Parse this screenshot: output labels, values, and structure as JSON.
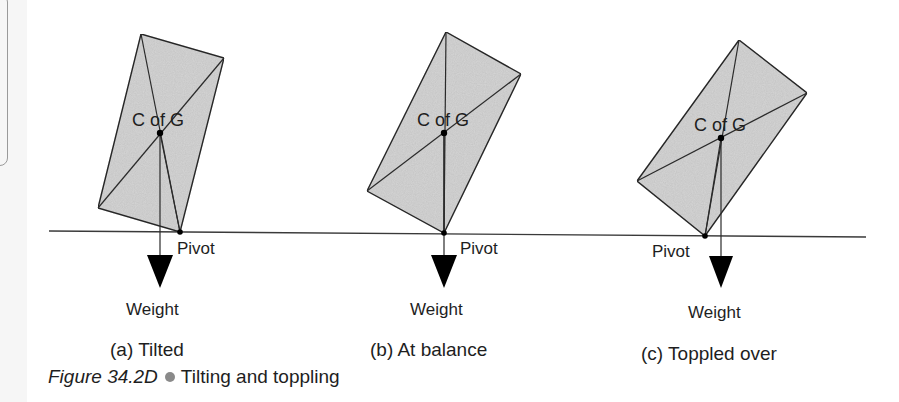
{
  "figure": {
    "number": "Figure 34.2D",
    "title": "Tilting and toppling",
    "bullet_color": "#8a8a8a"
  },
  "colors": {
    "block_fill": "#d6d6d6",
    "stroke": "#2a2a2a",
    "arrow": "#000000",
    "ground": "#3a3a3a"
  },
  "ground_line": {
    "x1": 49,
    "y1": 231,
    "x2": 866,
    "y2": 237
  },
  "panels": [
    {
      "id": "a",
      "caption": "(a) Tilted",
      "cog_label": "C of G",
      "pivot_label": "Pivot",
      "weight_label": "Weight",
      "corners": {
        "top": [
          141,
          34
        ],
        "right": [
          224,
          58
        ],
        "bottom": [
          180,
          232
        ],
        "left": [
          98,
          208
        ]
      },
      "cog": [
        160,
        133
      ],
      "arrow": {
        "x": 160,
        "tri_top": 255,
        "tri_bottom": 288,
        "half_width": 13
      },
      "cog_text": [
        132,
        126
      ],
      "pivot_text": [
        177,
        254
      ],
      "weight_text": [
        126,
        315
      ],
      "caption_pos": [
        110,
        356
      ]
    },
    {
      "id": "b",
      "caption": "(b) At balance",
      "cog_label": "C of G",
      "pivot_label": "Pivot",
      "weight_label": "Weight",
      "corners": {
        "top": [
          446,
          32
        ],
        "right": [
          521,
          74
        ],
        "bottom": [
          444,
          233
        ],
        "left": [
          367,
          191
        ]
      },
      "cog": [
        444,
        133
      ],
      "arrow": {
        "x": 444,
        "tri_top": 255,
        "tri_bottom": 288,
        "half_width": 13
      },
      "cog_text": [
        417,
        126
      ],
      "pivot_text": [
        460,
        254
      ],
      "weight_text": [
        410,
        315
      ],
      "caption_pos": [
        370,
        356
      ]
    },
    {
      "id": "c",
      "caption": "(c) Toppled over",
      "cog_label": "C of G",
      "pivot_label": "Pivot",
      "weight_label": "Weight",
      "corners": {
        "top": [
          739,
          40
        ],
        "right": [
          807,
          93
        ],
        "bottom": [
          705,
          236
        ],
        "left": [
          637,
          181
        ]
      },
      "cog": [
        721,
        138
      ],
      "arrow": {
        "x": 721,
        "tri_top": 256,
        "tri_bottom": 288,
        "half_width": 12
      },
      "cog_text": [
        694,
        131
      ],
      "pivot_text": [
        652,
        257
      ],
      "weight_text": [
        688,
        318
      ],
      "caption_pos": [
        641,
        360
      ]
    }
  ]
}
